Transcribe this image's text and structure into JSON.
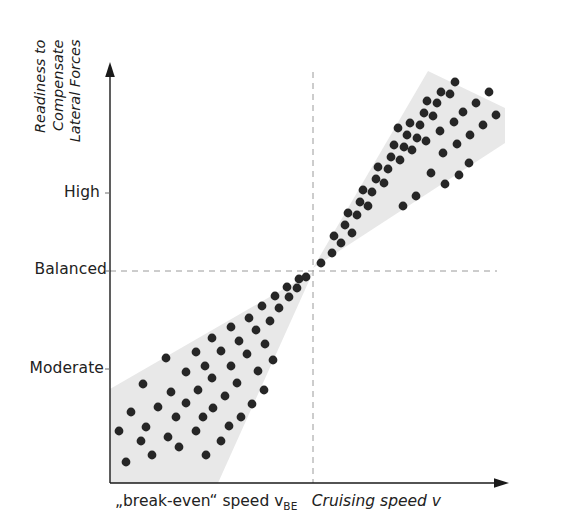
{
  "chart_data": {
    "type": "scatter",
    "title": "",
    "subtitle": "",
    "xlabel": "Cruising speed v",
    "ylabel": "Readiness to Compensate Lateral Forces",
    "x_axis": {
      "label_prefix": "„break-even“ speed v",
      "label_prefix_subscript": "BE",
      "label_italic": "Cruising speed v",
      "arrow": true,
      "ticks": [],
      "reference_value_label": "„break-even“ speed v_BE"
    },
    "y_axis": {
      "label_lines": [
        "Readiness to",
        "Compensate",
        "Lateral Forces"
      ],
      "arrow": true,
      "ticks": [
        {
          "label": "High",
          "value": 2
        },
        {
          "label": "Balanced",
          "value": 1
        },
        {
          "label": "Moderate",
          "value": 0
        }
      ]
    },
    "reference_lines": [
      {
        "orientation": "horizontal",
        "label": "Balanced",
        "style": "dashed"
      },
      {
        "orientation": "vertical",
        "label": "„break-even“ speed v_BE",
        "style": "dashed"
      }
    ],
    "regions": [
      {
        "name": "lower-left-cone",
        "description": "Shaded wedge widening downward-left from the break-even crossing point toward moderate readiness at low cruising speed",
        "fill": "#e8e8e8"
      },
      {
        "name": "upper-right-cone",
        "description": "Shaded wedge widening upward-right from the break-even crossing point toward high readiness at high cruising speed",
        "fill": "#e8e8e8"
      }
    ],
    "series": [
      {
        "name": "moderate-readiness-cluster",
        "marker": "filled-circle",
        "color": "#262626",
        "points": [
          [
            126,
            462
          ],
          [
            152,
            455
          ],
          [
            179,
            447
          ],
          [
            206,
            455
          ],
          [
            141,
            441
          ],
          [
            168,
            437
          ],
          [
            119,
            431
          ],
          [
            146,
            427
          ],
          [
            196,
            431
          ],
          [
            221,
            441
          ],
          [
            176,
            417
          ],
          [
            203,
            417
          ],
          [
            229,
            426
          ],
          [
            131,
            412
          ],
          [
            158,
            407
          ],
          [
            186,
            403
          ],
          [
            213,
            408
          ],
          [
            241,
            417
          ],
          [
            171,
            392
          ],
          [
            198,
            390
          ],
          [
            225,
            396
          ],
          [
            252,
            404
          ],
          [
            143,
            384
          ],
          [
            212,
            378
          ],
          [
            237,
            383
          ],
          [
            264,
            390
          ],
          [
            186,
            372
          ],
          [
            205,
            366
          ],
          [
            231,
            366
          ],
          [
            258,
            371
          ],
          [
            166,
            358
          ],
          [
            196,
            352
          ],
          [
            221,
            351
          ],
          [
            247,
            354
          ],
          [
            273,
            360
          ],
          [
            212,
            338
          ],
          [
            239,
            341
          ],
          [
            265,
            344
          ],
          [
            231,
            327
          ],
          [
            256,
            330
          ],
          [
            249,
            318
          ],
          [
            270,
            321
          ],
          [
            262,
            306
          ],
          [
            279,
            308
          ],
          [
            275,
            296
          ],
          [
            289,
            297
          ],
          [
            287,
            287
          ],
          [
            297,
            288
          ],
          [
            299,
            279
          ],
          [
            306,
            277
          ]
        ]
      },
      {
        "name": "high-readiness-cluster",
        "marker": "filled-circle",
        "color": "#262626",
        "points": [
          [
            321,
            263
          ],
          [
            332,
            253
          ],
          [
            341,
            243
          ],
          [
            352,
            233
          ],
          [
            334,
            236
          ],
          [
            345,
            225
          ],
          [
            357,
            215
          ],
          [
            368,
            206
          ],
          [
            348,
            213
          ],
          [
            360,
            202
          ],
          [
            372,
            192
          ],
          [
            384,
            183
          ],
          [
            363,
            190
          ],
          [
            376,
            179
          ],
          [
            388,
            169
          ],
          [
            400,
            160
          ],
          [
            378,
            167
          ],
          [
            391,
            157
          ],
          [
            404,
            147
          ],
          [
            417,
            138
          ],
          [
            394,
            145
          ],
          [
            407,
            135
          ],
          [
            420,
            125
          ],
          [
            433,
            116
          ],
          [
            410,
            123
          ],
          [
            424,
            113
          ],
          [
            437,
            103
          ],
          [
            450,
            94
          ],
          [
            427,
            101
          ],
          [
            441,
            92
          ],
          [
            455,
            82
          ],
          [
            398,
            128
          ],
          [
            412,
            150
          ],
          [
            426,
            141
          ],
          [
            440,
            131
          ],
          [
            454,
            122
          ],
          [
            443,
            153
          ],
          [
            457,
            144
          ],
          [
            470,
            135
          ],
          [
            463,
            112
          ],
          [
            476,
            103
          ],
          [
            469,
            163
          ],
          [
            483,
            125
          ],
          [
            489,
            92
          ],
          [
            496,
            115
          ],
          [
            431,
            173
          ],
          [
            445,
            184
          ],
          [
            459,
            175
          ],
          [
            416,
            196
          ],
          [
            403,
            206
          ]
        ]
      }
    ],
    "grid": false,
    "legend": null
  }
}
